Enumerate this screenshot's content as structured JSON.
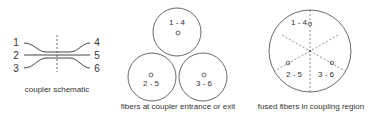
{
  "schematic": {
    "caption": "coupler schematic",
    "left_labels": [
      "1",
      "2",
      "3"
    ],
    "right_labels": [
      "4",
      "5",
      "6"
    ]
  },
  "entrance": {
    "caption": "fibers at coupler entrance or exit",
    "fibers": [
      "1 - 4",
      "2 - 5",
      "3 - 6"
    ]
  },
  "fused": {
    "caption": "fused fibers in coupling region",
    "fibers": [
      "1 - 4",
      "2 - 5",
      "3 - 6"
    ]
  },
  "colors": {
    "stroke": "#444444",
    "text": "#333333"
  }
}
